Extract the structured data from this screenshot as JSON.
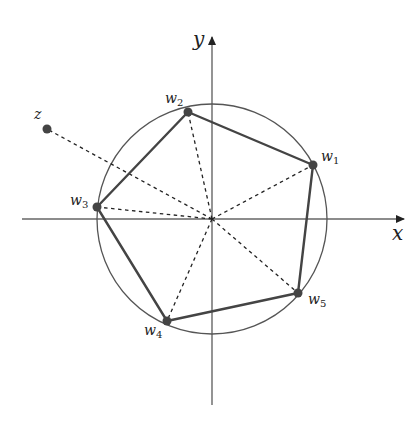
{
  "figure": {
    "colors": {
      "background": "#ffffff",
      "axis": "#555555",
      "circle": "#555555",
      "polygon": "#444444",
      "dashed": "#222222",
      "point": "#444444",
      "text": "#222222"
    },
    "axes": {
      "x_label": "x",
      "y_label": "y"
    },
    "labels": {
      "z": "z",
      "w1_main": "w",
      "w1_sub": "1",
      "w2_main": "w",
      "w2_sub": "2",
      "w3_main": "w",
      "w3_sub": "3",
      "w4_main": "w",
      "w4_sub": "4",
      "w5_main": "w",
      "w5_sub": "5"
    },
    "points": [
      {
        "name": "w1",
        "x": 313,
        "y": 165
      },
      {
        "name": "w2",
        "x": 188,
        "y": 112
      },
      {
        "name": "w3",
        "x": 97,
        "y": 207
      },
      {
        "name": "w4",
        "x": 167,
        "y": 321
      },
      {
        "name": "w5",
        "x": 298,
        "y": 293
      },
      {
        "name": "z",
        "x": 47,
        "y": 129
      }
    ],
    "origin": {
      "x": 212,
      "y": 219
    },
    "circle_radius": 115
  }
}
